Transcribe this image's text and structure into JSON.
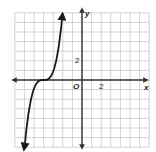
{
  "chart_data": {
    "type": "line",
    "title": "",
    "xlabel": "x",
    "ylabel": "y",
    "origin_label": "O",
    "x_tick_label": "2",
    "y_tick_label": "2",
    "xlim": [
      -7,
      7
    ],
    "ylim": [
      -7,
      7
    ],
    "grid": true,
    "function": "cubic, y = (x+4)^3 shape, inflection at (-4, 0)",
    "series": [
      {
        "name": "f(x)",
        "points": [
          [
            -6,
            -7
          ],
          [
            -5.5,
            -3.4
          ],
          [
            -5,
            -1
          ],
          [
            -4.5,
            -0.1
          ],
          [
            -4,
            0
          ],
          [
            -3.5,
            0.1
          ],
          [
            -3,
            1
          ],
          [
            -2.5,
            3.4
          ],
          [
            -2,
            7
          ]
        ]
      }
    ],
    "colors": {
      "grid": "#c8c8c8",
      "axis": "#333333",
      "curve": "#1a1a1a"
    }
  }
}
